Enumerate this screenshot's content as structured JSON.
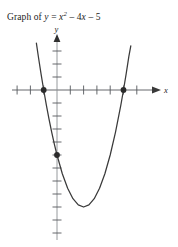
{
  "caption": {
    "prefix": "Graph of",
    "lhs": "y",
    "equals": "=",
    "var": "x",
    "exponent": "2",
    "term_minus_1": "– 4",
    "term_var": "x",
    "term_minus_2": "– 5",
    "full_text": "Graph of y = x² – 4x – 5"
  },
  "axes": {
    "x_label": "x",
    "y_label": "y",
    "origin_px": [
      57,
      90
    ],
    "unit_px_x": 13.3,
    "unit_px_y": 13.0,
    "x_tick_values": [
      -3,
      -2,
      -1,
      1,
      2,
      3,
      4,
      5,
      6
    ],
    "y_tick_values": [
      3,
      2,
      1,
      -1,
      -2,
      -3,
      -4,
      -5,
      -6,
      -7,
      -8,
      -9,
      -10,
      -11
    ],
    "x_arrow": "right-arrow",
    "y_arrow": "up-arrow",
    "stroke_color": "#55585c",
    "tick_color": "#55585c"
  },
  "chart_data": {
    "type": "line",
    "xlabel": "x",
    "ylabel": "y",
    "grid": false,
    "legend": "none",
    "xlim": [
      -3.2,
      6.3
    ],
    "ylim": [
      -11.5,
      3.5
    ],
    "function": "y = x^2 - 4x - 5",
    "curve_color": "#3a3a3a",
    "marked_point_color": "#2b2b2b",
    "series": [
      {
        "name": "y = x^2 - 4x - 5",
        "x": [
          -1.55,
          -1.4,
          -1.2,
          -1.0,
          -0.8,
          -0.6,
          -0.4,
          -0.2,
          0.0,
          0.4,
          0.8,
          1.2,
          1.6,
          2.0,
          2.4,
          2.8,
          3.2,
          3.6,
          4.0,
          4.4,
          4.8,
          5.0,
          5.2,
          5.4,
          5.55
        ],
        "y": [
          3.6,
          2.56,
          1.24,
          0.0,
          -1.16,
          -2.24,
          -3.24,
          -4.16,
          -5.0,
          -6.44,
          -7.56,
          -8.36,
          -8.84,
          -9.0,
          -8.84,
          -8.36,
          -7.56,
          -6.44,
          -5.0,
          -3.24,
          -1.16,
          0.0,
          1.24,
          2.56,
          3.4
        ]
      }
    ],
    "marked_points": [
      {
        "label": "x-intercept-left",
        "x": -1,
        "y": 0
      },
      {
        "label": "y-intercept",
        "x": 0,
        "y": -5
      },
      {
        "label": "x-intercept-right",
        "x": 5,
        "y": 0
      }
    ],
    "vertex": {
      "x": 2,
      "y": -9
    }
  }
}
